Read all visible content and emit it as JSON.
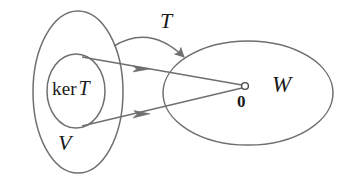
{
  "figure": {
    "kind": "linear-algebra-kernel-diagram",
    "width": 349,
    "height": 187,
    "background_color": "#ffffff",
    "stroke_color": "#6f6f6f",
    "text_color": "#1a1a1a"
  },
  "labels": {
    "kernel_operator": "ker",
    "kernel_map": "T",
    "domain": "V",
    "map": "T",
    "codomain": "W",
    "zero_vector": "0"
  },
  "shapes": {
    "domain_ellipse": {
      "name": "V",
      "cx": 78,
      "cy": 92,
      "rx": 45,
      "ry": 81
    },
    "kernel_ellipse": {
      "name": "ker T",
      "cx": 76,
      "cy": 91,
      "rx": 29,
      "ry": 37
    },
    "codomain_ellipse": {
      "name": "W",
      "cx": 248,
      "cy": 93,
      "rx": 85,
      "ry": 52
    },
    "zero_point": {
      "name": "0",
      "cx": 245,
      "cy": 86,
      "r": 3.4
    }
  },
  "arrows": [
    {
      "name": "map-arrow-T",
      "style": "curved",
      "from_x": 114,
      "from_y": 46,
      "to_x": 184,
      "to_y": 57,
      "control_x": 150,
      "control_y": 24
    },
    {
      "name": "kernel-arrow-upper",
      "style": "straight",
      "from_x": 82,
      "from_y": 57,
      "to_x": 243,
      "to_y": 85
    },
    {
      "name": "kernel-arrow-lower",
      "style": "straight",
      "from_x": 82,
      "from_y": 126,
      "to_x": 243,
      "to_y": 88
    }
  ]
}
